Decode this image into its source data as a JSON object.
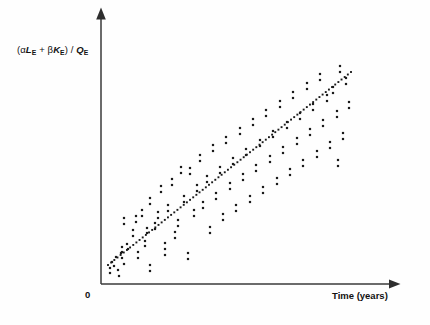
{
  "figure": {
    "background_color": "#fefefe",
    "ink_color": "#1a1a1a",
    "axis_color": "#3a3a3a",
    "width": 430,
    "height": 325
  },
  "labels": {
    "y_axis_full": "(αLE + βKE) / QE",
    "y_axis_open_paren": "(",
    "y_axis_alpha": "α",
    "y_axis_L": "L",
    "y_axis_sub_E1": "E",
    "y_axis_plus": " + ",
    "y_axis_beta": "β",
    "y_axis_K": "K",
    "y_axis_sub_E2": "E",
    "y_axis_close_paren": ")",
    "y_axis_slash": " / ",
    "y_axis_Q": "Q",
    "y_axis_sub_E3": "E",
    "x_axis": "Time (years)",
    "origin": "0"
  },
  "chart_data": {
    "type": "scatter",
    "title": "",
    "subtitle": "",
    "xlabel": "Time (years)",
    "ylabel": "(αLE + βKE) / QE",
    "grid": false,
    "legend": null,
    "axes": {
      "x_axis_line": {
        "x1": 101,
        "y1": 284,
        "x2": 390,
        "y2": 284,
        "arrow": "right"
      },
      "y_axis_line": {
        "x1": 101,
        "y1": 284,
        "x2": 101,
        "y2": 18,
        "arrow": "up"
      },
      "x_tick_labels": [
        "0"
      ],
      "y_tick_labels": [],
      "xlim_px": [
        101,
        390
      ],
      "ylim_px": [
        284,
        18
      ],
      "origin_px": {
        "x": 101,
        "y": 284
      }
    },
    "marker": {
      "shape": "square",
      "size_px": 2.2,
      "color": "#1a1a1a"
    },
    "trendline": {
      "style": "dotted",
      "dot_size_px": 1.9,
      "dot_spacing_px": 4.0,
      "color": "#1a1a1a",
      "x1": 108,
      "y1": 265,
      "x2": 351,
      "y2": 72,
      "slope_px": -0.794,
      "description": "positive linear trend, dotted"
    },
    "points_px": [
      [
        110,
        268
      ],
      [
        110,
        273
      ],
      [
        112,
        262
      ],
      [
        114,
        266
      ],
      [
        116,
        257
      ],
      [
        118,
        270
      ],
      [
        119,
        276
      ],
      [
        121,
        253
      ],
      [
        122,
        258
      ],
      [
        124,
        264
      ],
      [
        122,
        247
      ],
      [
        122,
        252
      ],
      [
        124,
        218
      ],
      [
        124,
        224
      ],
      [
        127,
        244
      ],
      [
        128,
        249
      ],
      [
        133,
        230
      ],
      [
        133,
        236
      ],
      [
        136,
        216
      ],
      [
        136,
        222
      ],
      [
        138,
        252
      ],
      [
        138,
        258
      ],
      [
        142,
        210
      ],
      [
        142,
        216
      ],
      [
        145,
        241
      ],
      [
        145,
        246
      ],
      [
        147,
        228
      ],
      [
        147,
        233
      ],
      [
        150,
        198
      ],
      [
        150,
        204
      ],
      [
        150,
        265
      ],
      [
        150,
        271
      ],
      [
        155,
        223
      ],
      [
        155,
        229
      ],
      [
        158,
        212
      ],
      [
        158,
        218
      ],
      [
        161,
        186
      ],
      [
        161,
        192
      ],
      [
        165,
        243
      ],
      [
        165,
        249
      ],
      [
        165,
        255
      ],
      [
        168,
        205
      ],
      [
        168,
        211
      ],
      [
        172,
        179
      ],
      [
        172,
        185
      ],
      [
        175,
        232
      ],
      [
        175,
        238
      ],
      [
        178,
        220
      ],
      [
        178,
        226
      ],
      [
        181,
        167
      ],
      [
        181,
        173
      ],
      [
        184,
        196
      ],
      [
        184,
        202
      ],
      [
        188,
        253
      ],
      [
        188,
        259
      ],
      [
        190,
        168
      ],
      [
        190,
        174
      ],
      [
        194,
        210
      ],
      [
        194,
        216
      ],
      [
        197,
        185
      ],
      [
        197,
        191
      ],
      [
        200,
        155
      ],
      [
        200,
        161
      ],
      [
        203,
        202
      ],
      [
        203,
        208
      ],
      [
        207,
        176
      ],
      [
        207,
        182
      ],
      [
        210,
        227
      ],
      [
        210,
        233
      ],
      [
        213,
        145
      ],
      [
        213,
        151
      ],
      [
        216,
        193
      ],
      [
        216,
        199
      ],
      [
        220,
        167
      ],
      [
        220,
        173
      ],
      [
        223,
        214
      ],
      [
        223,
        220
      ],
      [
        226,
        137
      ],
      [
        226,
        143
      ],
      [
        230,
        183
      ],
      [
        230,
        189
      ],
      [
        233,
        158
      ],
      [
        233,
        164
      ],
      [
        236,
        205
      ],
      [
        236,
        211
      ],
      [
        240,
        128
      ],
      [
        240,
        134
      ],
      [
        243,
        174
      ],
      [
        243,
        180
      ],
      [
        246,
        149
      ],
      [
        246,
        155
      ],
      [
        250,
        196
      ],
      [
        250,
        202
      ],
      [
        253,
        119
      ],
      [
        253,
        125
      ],
      [
        256,
        165
      ],
      [
        256,
        171
      ],
      [
        260,
        140
      ],
      [
        260,
        146
      ],
      [
        263,
        187
      ],
      [
        263,
        193
      ],
      [
        266,
        110
      ],
      [
        266,
        116
      ],
      [
        270,
        156
      ],
      [
        270,
        162
      ],
      [
        273,
        131
      ],
      [
        273,
        137
      ],
      [
        277,
        178
      ],
      [
        277,
        184
      ],
      [
        280,
        101
      ],
      [
        280,
        107
      ],
      [
        283,
        147
      ],
      [
        283,
        153
      ],
      [
        287,
        122
      ],
      [
        287,
        128
      ],
      [
        290,
        169
      ],
      [
        290,
        175
      ],
      [
        293,
        92
      ],
      [
        293,
        98
      ],
      [
        297,
        138
      ],
      [
        297,
        144
      ],
      [
        300,
        113
      ],
      [
        300,
        119
      ],
      [
        303,
        160
      ],
      [
        303,
        166
      ],
      [
        307,
        83
      ],
      [
        307,
        89
      ],
      [
        310,
        129
      ],
      [
        310,
        135
      ],
      [
        313,
        104
      ],
      [
        313,
        110
      ],
      [
        317,
        151
      ],
      [
        317,
        157
      ],
      [
        320,
        74
      ],
      [
        320,
        80
      ],
      [
        323,
        120
      ],
      [
        323,
        126
      ],
      [
        327,
        95
      ],
      [
        327,
        101
      ],
      [
        330,
        142
      ],
      [
        330,
        148
      ],
      [
        333,
        87
      ],
      [
        333,
        93
      ],
      [
        337,
        111
      ],
      [
        337,
        117
      ],
      [
        340,
        66
      ],
      [
        340,
        72
      ],
      [
        343,
        133
      ],
      [
        343,
        139
      ],
      [
        346,
        78
      ],
      [
        346,
        84
      ],
      [
        349,
        102
      ],
      [
        349,
        108
      ],
      [
        338,
        160
      ],
      [
        338,
        166
      ]
    ],
    "n_points": 152
  }
}
